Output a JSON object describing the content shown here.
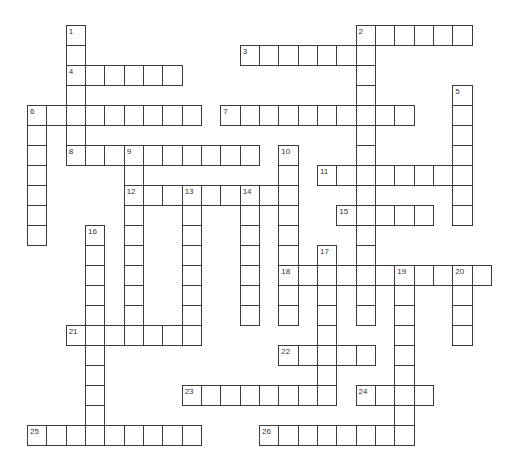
{
  "puzzle": {
    "type": "crossword",
    "grid": {
      "origin_x": 27,
      "origin_y": 25,
      "cell_width": 19.33,
      "cell_height": 20,
      "line_color": "#3a3a3a",
      "cell_fill": "#ffffff"
    },
    "across": [
      {
        "number": 2,
        "row": 0,
        "col": 17,
        "length": 6
      },
      {
        "number": 3,
        "row": 1,
        "col": 11,
        "length": 7
      },
      {
        "number": 4,
        "row": 2,
        "col": 2,
        "length": 6
      },
      {
        "number": 6,
        "row": 4,
        "col": 0,
        "length": 9
      },
      {
        "number": 7,
        "row": 4,
        "col": 10,
        "length": 10
      },
      {
        "number": 8,
        "row": 6,
        "col": 2,
        "length": 10
      },
      {
        "number": 11,
        "row": 7,
        "col": 15,
        "length": 8
      },
      {
        "number": 12,
        "row": 8,
        "col": 5,
        "length": 9
      },
      {
        "number": 15,
        "row": 9,
        "col": 16,
        "length": 5
      },
      {
        "number": 18,
        "row": 12,
        "col": 13,
        "length": 11
      },
      {
        "number": 21,
        "row": 15,
        "col": 2,
        "length": 7
      },
      {
        "number": 22,
        "row": 16,
        "col": 13,
        "length": 5
      },
      {
        "number": 23,
        "row": 18,
        "col": 8,
        "length": 8
      },
      {
        "number": 24,
        "row": 18,
        "col": 17,
        "length": 4
      },
      {
        "number": 25,
        "row": 20,
        "col": 0,
        "length": 9
      },
      {
        "number": 26,
        "row": 20,
        "col": 12,
        "length": 8
      }
    ],
    "down": [
      {
        "number": 1,
        "row": 0,
        "col": 2,
        "length": 7
      },
      {
        "number": 2,
        "row": 0,
        "col": 17,
        "length": 15
      },
      {
        "number": 5,
        "row": 3,
        "col": 22,
        "length": 7
      },
      {
        "number": 6,
        "row": 4,
        "col": 0,
        "length": 7
      },
      {
        "number": 9,
        "row": 6,
        "col": 5,
        "length": 9
      },
      {
        "number": 10,
        "row": 6,
        "col": 13,
        "length": 9
      },
      {
        "number": 13,
        "row": 8,
        "col": 8,
        "length": 8
      },
      {
        "number": 14,
        "row": 8,
        "col": 11,
        "length": 7
      },
      {
        "number": 16,
        "row": 10,
        "col": 3,
        "length": 11
      },
      {
        "number": 17,
        "row": 11,
        "col": 15,
        "length": 8
      },
      {
        "number": 19,
        "row": 12,
        "col": 19,
        "length": 9
      },
      {
        "number": 20,
        "row": 12,
        "col": 22,
        "length": 4
      }
    ]
  }
}
